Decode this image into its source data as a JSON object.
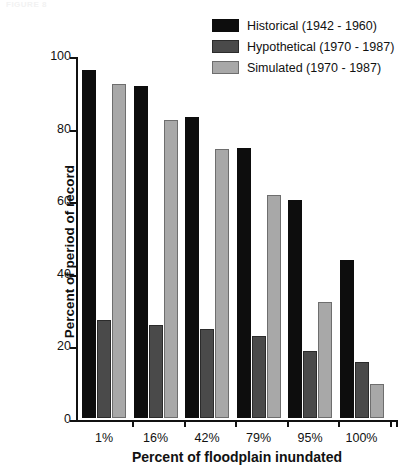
{
  "top_fragment": "FIGURE 8",
  "legend": {
    "items": [
      {
        "label": "Historical (1942 - 1960)",
        "color": "#0d0d0d",
        "border": "#0d0d0d",
        "name": "historical"
      },
      {
        "label": "Hypothetical (1970 - 1987)",
        "color": "#4a4a4a",
        "border": "#2b2b2b",
        "name": "hypothetical"
      },
      {
        "label": "Simulated (1970 - 1987)",
        "color": "#a8a8a8",
        "border": "#6e6e6e",
        "name": "simulated"
      }
    ]
  },
  "chart_data": {
    "type": "bar",
    "title": "",
    "xlabel": "Percent of floodplain inundated",
    "ylabel": "Percent of period of record",
    "categories": [
      "1%",
      "16%",
      "42%",
      "79%",
      "95%",
      "100%"
    ],
    "series": [
      {
        "name": "Historical (1942 - 1960)",
        "values": [
          96,
          91.5,
          83,
          74.5,
          60,
          43.5
        ]
      },
      {
        "name": "Hypothetical (1970 - 1987)",
        "values": [
          27,
          25.5,
          24.5,
          22.5,
          18.5,
          15.5
        ]
      },
      {
        "name": "Simulated (1970 - 1987)",
        "values": [
          92,
          82,
          74,
          61.5,
          32,
          9.5
        ]
      }
    ],
    "ylim": [
      0,
      100
    ],
    "yticks": [
      0,
      20,
      40,
      60,
      80,
      100
    ],
    "ytick_labels": [
      "0",
      "20",
      "40",
      "60",
      "80",
      "100"
    ],
    "grid": false,
    "legend_position": "top-right"
  }
}
